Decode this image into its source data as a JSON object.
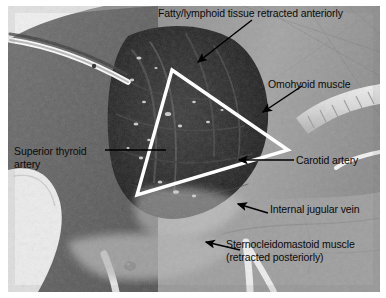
{
  "figure": {
    "type": "surgical-anatomy-photograph",
    "overlay_shape": "triangle",
    "overlay_color": "#ffffff",
    "label_color": "#0a0a0a",
    "leader_color": "#000000"
  },
  "annotations": [
    {
      "id": "fatty-lymphoid-tissue",
      "label": "Fatty/lymphoid tissue retracted anteriorly",
      "leader": "arrow",
      "position": "top"
    },
    {
      "id": "omohyoid-muscle",
      "label": "Omohyoid muscle",
      "leader": "arrow",
      "position": "right-upper"
    },
    {
      "id": "superior-thyroid-artery",
      "label_line1": "Superior thyroid",
      "label_line2": "artery",
      "leader": "line",
      "position": "left"
    },
    {
      "id": "carotid-artery",
      "label": "Carotid artery",
      "leader": "line-arrow",
      "position": "right-middle"
    },
    {
      "id": "internal-jugular-vein",
      "label": "Internal jugular vein",
      "leader": "arrow",
      "position": "right-lower"
    },
    {
      "id": "sternocleidomastoid-muscle",
      "label_line1": "Sternocleidomastoid muscle",
      "label_line2": "(retracted posteriorly)",
      "leader": "arrow",
      "position": "bottom-right"
    }
  ],
  "triangle": {
    "vertex_top": "172,70",
    "vertex_right": "288,150",
    "vertex_bottom_left": "137,195"
  }
}
